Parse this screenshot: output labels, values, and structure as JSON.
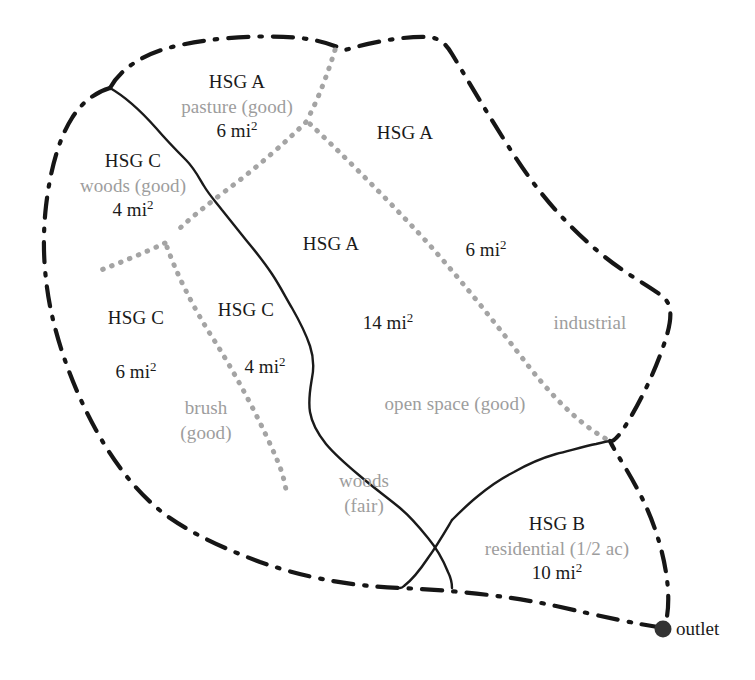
{
  "diagram": {
    "colors": {
      "divide": "#161616",
      "stream": "#1a1a1a",
      "subbasin": "#a0a0a0",
      "hsg_text": "#1a1a1a",
      "landuse_text": "#9d9d9d",
      "area_text": "#1a1a1a",
      "background": "#ffffff"
    },
    "area_unit": "mi",
    "area_exponent": "2",
    "subareas": [
      {
        "id": "pasture-a",
        "hsg": "HSG A",
        "land_use": "pasture (good)",
        "area": "6 mi",
        "exponent": "2",
        "x": 237,
        "y": 77
      },
      {
        "id": "woods-c",
        "hsg": "HSG C",
        "land_use": "woods (good)",
        "area": "4 mi",
        "exponent": "2",
        "x": 133,
        "y": 155
      },
      {
        "id": "brush-c",
        "hsg": "HSG C",
        "land_use": "brush (good)",
        "area": "6 mi",
        "exponent": "2",
        "x": 136,
        "y": 306
      },
      {
        "id": "woods-fair-c",
        "hsg": "HSG C",
        "land_use": "woods (fair)",
        "area": "4 mi",
        "exponent": "2",
        "x": 246,
        "y": 298
      },
      {
        "id": "open-space-a",
        "hsg": "HSG A",
        "land_use": "open space (good)",
        "area": "14 mi",
        "exponent": "2",
        "x": 331,
        "y": 233
      },
      {
        "id": "industrial-a",
        "hsg": "HSG A",
        "land_use": "industrial",
        "area": "6 mi",
        "exponent": "2",
        "x": 405,
        "y": 120
      },
      {
        "id": "residential-b",
        "hsg": "HSG B",
        "land_use": "residential (1/2 ac)",
        "area": "10 mi",
        "exponent": "2",
        "x": 557,
        "y": 519
      }
    ],
    "split_labels": {
      "brush_use_line1": "brush",
      "brush_use_line2": "(good)",
      "brush_use_x": 206,
      "brush_use_y": 396,
      "woods_fair_line1": "woods",
      "woods_fair_line2": "(fair)",
      "woods_fair_x": 364,
      "woods_fair_y": 469,
      "open_space_use": "open space (good)",
      "open_space_use_x": 455,
      "open_space_use_y": 392,
      "industrial_use": "industrial",
      "industrial_use_x": 590,
      "industrial_use_y": 311,
      "hsg_a_right_area": "6 mi",
      "hsg_a_right_area_exp": "2",
      "hsg_a_right_area_x": 486,
      "hsg_a_right_area_y": 238
    },
    "outlet": {
      "label": "outlet",
      "marker_x": 663,
      "marker_y": 629,
      "label_x": 676,
      "label_y": 621
    }
  }
}
